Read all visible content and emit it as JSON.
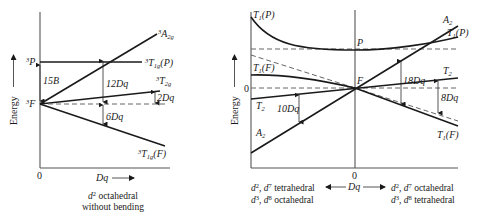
{
  "left_panel": {
    "y_axis_label": "Energy",
    "x_axis_label": "Dq",
    "origin_label": "0",
    "caption_line1_prefix": "d",
    "caption_line1_sup": "2",
    "caption_line1_rest": " octahedral",
    "caption_line2": "without bending",
    "levels": {
      "free_ion_F": {
        "sup": "3",
        "text": "F"
      },
      "free_ion_P": {
        "sup": "3",
        "text": "P"
      },
      "A2g": {
        "sup": "3",
        "text": "A",
        "sub": "2g"
      },
      "T1gP": {
        "sup": "3",
        "text": "T",
        "sub": "1g",
        "suffix": "(P)"
      },
      "T2g": {
        "sup": "3",
        "text": "T",
        "sub": "2g"
      },
      "T1gF": {
        "sup": "3",
        "text": "T",
        "sub": "1g",
        "suffix": "(F)"
      }
    },
    "dimensions": {
      "separation_PF": "15B",
      "A2g_gap": "12Dq",
      "T2g_gap": "2Dq",
      "T1gF_gap": "6Dq"
    }
  },
  "right_panel": {
    "y_axis_label": "Energy",
    "zero_label": "0",
    "x_zero_label": "0",
    "x_axis_label": "Dq",
    "free_ion_P": "P",
    "free_ion_F": "F",
    "left_side": {
      "T1P": {
        "text": "T",
        "sub": "1",
        "suffix": "(P)"
      },
      "T1F": {
        "text": "T",
        "sub": "1",
        "suffix": "(F)"
      },
      "T2": {
        "text": "T",
        "sub": "2"
      },
      "A2": {
        "text": "A",
        "sub": "2"
      },
      "gap_label": "10Dq",
      "caption_line1": {
        "a": "d",
        "a_sup": "2",
        "b": ", d",
        "b_sup": "7",
        "rest": " tetrahedral"
      },
      "caption_line2": {
        "a": "d",
        "a_sup": "3",
        "b": ", d",
        "b_sup": "8",
        "rest": " octahedral"
      }
    },
    "right_side": {
      "A2": {
        "text": "A",
        "sub": "2"
      },
      "T1P": {
        "text": "T",
        "sub": "1",
        "suffix": "(P)"
      },
      "T2": {
        "text": "T",
        "sub": "2"
      },
      "T1F": {
        "text": "T",
        "sub": "1",
        "suffix": "(F)"
      },
      "gap_label_A2": "18Dq",
      "gap_label_T2": "8Dq",
      "caption_line1": {
        "a": "d",
        "a_sup": "2",
        "b": ", d",
        "b_sup": "7",
        "rest": " octahedral"
      },
      "caption_line2": {
        "a": "d",
        "a_sup": "3",
        "b": ", d",
        "b_sup": "8",
        "rest": " tetrahedral"
      }
    }
  },
  "colors": {
    "line": "#1a1a1a",
    "axis": "#555555",
    "dashed": "#666666",
    "background": "#ffffff"
  }
}
